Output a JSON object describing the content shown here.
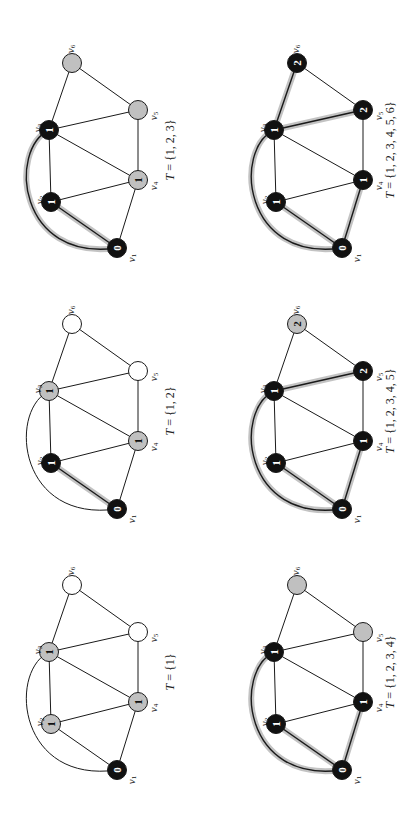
{
  "figure": {
    "vertex_names": [
      "v1",
      "v2",
      "v3",
      "v4",
      "v5",
      "v6"
    ],
    "edges": [
      [
        "v1",
        "v2"
      ],
      [
        "v1",
        "v3"
      ],
      [
        "v1",
        "v4"
      ],
      [
        "v2",
        "v3"
      ],
      [
        "v2",
        "v4"
      ],
      [
        "v3",
        "v4"
      ],
      [
        "v3",
        "v5"
      ],
      [
        "v3",
        "v6"
      ],
      [
        "v4",
        "v5"
      ],
      [
        "v5",
        "v6"
      ]
    ],
    "curved_edges": [
      [
        "v1",
        "v3"
      ]
    ],
    "colors": {
      "visited": "#111111",
      "frontier": "#c0c0c0",
      "unvisited": "#ffffff",
      "tree_edge_halo": "#b8b8b8",
      "edge": "#1a1a1a"
    }
  },
  "panels": [
    {
      "id": "panel-t1",
      "caption": "T = {1}",
      "position": "bottom-left",
      "origin": [
        0,
        522
      ],
      "nodes": {
        "v1": {
          "state": "visited",
          "dist": "0"
        },
        "v2": {
          "state": "frontier",
          "dist": "1"
        },
        "v3": {
          "state": "frontier",
          "dist": "1"
        },
        "v4": {
          "state": "frontier",
          "dist": "1"
        },
        "v5": {
          "state": "unvisited",
          "dist": ""
        },
        "v6": {
          "state": "unvisited",
          "dist": ""
        }
      },
      "tree_edges": []
    },
    {
      "id": "panel-t12",
      "caption": "T = {1, 2}",
      "position": "middle-left",
      "origin": [
        0,
        261
      ],
      "nodes": {
        "v1": {
          "state": "visited",
          "dist": "0"
        },
        "v2": {
          "state": "visited",
          "dist": "1"
        },
        "v3": {
          "state": "frontier",
          "dist": "1"
        },
        "v4": {
          "state": "frontier",
          "dist": "1"
        },
        "v5": {
          "state": "unvisited",
          "dist": ""
        },
        "v6": {
          "state": "unvisited",
          "dist": ""
        }
      },
      "tree_edges": [
        [
          "v1",
          "v2"
        ]
      ]
    },
    {
      "id": "panel-t123",
      "caption": "T = {1, 2, 3}",
      "position": "top-left",
      "origin": [
        0,
        0
      ],
      "nodes": {
        "v1": {
          "state": "visited",
          "dist": "0"
        },
        "v2": {
          "state": "visited",
          "dist": "1"
        },
        "v3": {
          "state": "visited",
          "dist": "1"
        },
        "v4": {
          "state": "frontier",
          "dist": "1"
        },
        "v5": {
          "state": "frontier",
          "dist": ""
        },
        "v6": {
          "state": "frontier",
          "dist": ""
        }
      },
      "tree_edges": [
        [
          "v1",
          "v2"
        ],
        [
          "v1",
          "v3"
        ]
      ]
    },
    {
      "id": "panel-t1234",
      "caption": "T = {1, 2, 3, 4}",
      "position": "bottom-right",
      "origin": [
        225,
        522
      ],
      "nodes": {
        "v1": {
          "state": "visited",
          "dist": "0"
        },
        "v2": {
          "state": "visited",
          "dist": "1"
        },
        "v3": {
          "state": "visited",
          "dist": "1"
        },
        "v4": {
          "state": "visited",
          "dist": "1"
        },
        "v5": {
          "state": "frontier",
          "dist": ""
        },
        "v6": {
          "state": "frontier",
          "dist": ""
        }
      },
      "tree_edges": [
        [
          "v1",
          "v2"
        ],
        [
          "v1",
          "v3"
        ],
        [
          "v1",
          "v4"
        ]
      ]
    },
    {
      "id": "panel-t12345",
      "caption": "T = {1, 2, 3, 4, 5}",
      "position": "middle-right",
      "origin": [
        225,
        261
      ],
      "nodes": {
        "v1": {
          "state": "visited",
          "dist": "0"
        },
        "v2": {
          "state": "visited",
          "dist": "1"
        },
        "v3": {
          "state": "visited",
          "dist": "1"
        },
        "v4": {
          "state": "visited",
          "dist": "1"
        },
        "v5": {
          "state": "visited",
          "dist": "2"
        },
        "v6": {
          "state": "frontier",
          "dist": "2"
        }
      },
      "tree_edges": [
        [
          "v1",
          "v2"
        ],
        [
          "v1",
          "v3"
        ],
        [
          "v1",
          "v4"
        ],
        [
          "v3",
          "v5"
        ]
      ]
    },
    {
      "id": "panel-t123456",
      "caption": "T = {1, 2, 3, 4, 5, 6}",
      "position": "top-right",
      "origin": [
        225,
        0
      ],
      "nodes": {
        "v1": {
          "state": "visited",
          "dist": "0"
        },
        "v2": {
          "state": "visited",
          "dist": "1"
        },
        "v3": {
          "state": "visited",
          "dist": "1"
        },
        "v4": {
          "state": "visited",
          "dist": "1"
        },
        "v5": {
          "state": "visited",
          "dist": "2"
        },
        "v6": {
          "state": "visited",
          "dist": "2"
        }
      },
      "tree_edges": [
        [
          "v1",
          "v2"
        ],
        [
          "v1",
          "v3"
        ],
        [
          "v1",
          "v4"
        ],
        [
          "v3",
          "v5"
        ],
        [
          "v3",
          "v6"
        ]
      ]
    }
  ]
}
